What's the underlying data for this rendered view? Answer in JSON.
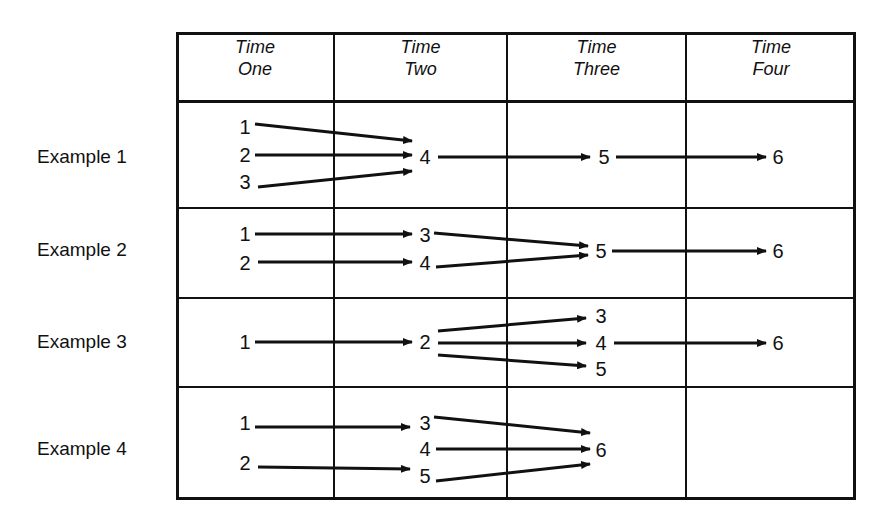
{
  "header": {
    "columns": [
      {
        "line1": "Time",
        "line2": "One"
      },
      {
        "line1": "Time",
        "line2": "Two"
      },
      {
        "line1": "Time",
        "line2": "Three"
      },
      {
        "line1": "Time",
        "line2": "Four"
      }
    ]
  },
  "rows": [
    {
      "label": "Example 1"
    },
    {
      "label": "Example 2"
    },
    {
      "label": "Example 3"
    },
    {
      "label": "Example 4"
    }
  ],
  "nodes": {
    "ex1": {
      "t1": [
        "1",
        "2",
        "3"
      ],
      "t2": [
        "4"
      ],
      "t3": [
        "5"
      ],
      "t4": [
        "6"
      ]
    },
    "ex2": {
      "t1": [
        "1",
        "2"
      ],
      "t2": [
        "3",
        "4"
      ],
      "t3": [
        "5"
      ],
      "t4": [
        "6"
      ]
    },
    "ex3": {
      "t1": [
        "1"
      ],
      "t2": [
        "2"
      ],
      "t3": [
        "3",
        "4",
        "5"
      ],
      "t4": [
        "6"
      ]
    },
    "ex4": {
      "t1": [
        "1",
        "2"
      ],
      "t2": [
        "3",
        "4",
        "5"
      ],
      "t3": [
        "6"
      ]
    }
  },
  "edges": {
    "ex1": [
      [
        "1",
        "4"
      ],
      [
        "2",
        "4"
      ],
      [
        "3",
        "4"
      ],
      [
        "4",
        "5"
      ],
      [
        "5",
        "6"
      ]
    ],
    "ex2": [
      [
        "1",
        "3"
      ],
      [
        "2",
        "4"
      ],
      [
        "3",
        "5"
      ],
      [
        "4",
        "5"
      ],
      [
        "5",
        "6"
      ]
    ],
    "ex3": [
      [
        "1",
        "2"
      ],
      [
        "2",
        "3"
      ],
      [
        "2",
        "4"
      ],
      [
        "2",
        "5"
      ],
      [
        "4",
        "6"
      ]
    ],
    "ex4": [
      [
        "1",
        "3"
      ],
      [
        "2",
        "5"
      ],
      [
        "3",
        "6"
      ],
      [
        "4",
        "6"
      ],
      [
        "5",
        "6"
      ]
    ]
  }
}
